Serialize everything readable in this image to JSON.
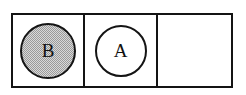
{
  "diagram": {
    "type": "three-cell-frame-with-tokens",
    "border_color": "#141414",
    "background_color": "#ffffff",
    "cells": [
      {
        "index": 1,
        "name": "cell-1",
        "occupied": true,
        "token": {
          "label": "B",
          "shape": "circle",
          "fill": "halftone-gray",
          "fill_color": "#d9d9d9",
          "stroke_color": "#141414"
        }
      },
      {
        "index": 2,
        "name": "cell-2",
        "occupied": true,
        "token": {
          "label": "A",
          "shape": "circle",
          "fill": "white",
          "fill_color": "#ffffff",
          "stroke_color": "#141414"
        }
      },
      {
        "index": 3,
        "name": "cell-3",
        "occupied": false,
        "token": null
      }
    ]
  }
}
